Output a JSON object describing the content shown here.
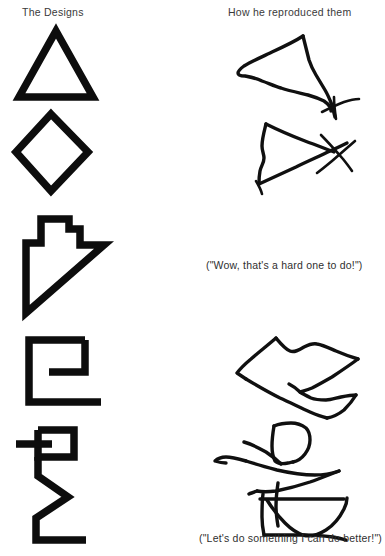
{
  "figure": {
    "background_color": "#ffffff",
    "ink_color": "#0d0d0d",
    "text_color": "#2f2f2f"
  },
  "headings": {
    "left": "The Designs",
    "right": "How he reproduced them"
  },
  "quotes": {
    "middle": "(\"Wow, that's a hard one to do!\")",
    "bottom": "(\"Let's do something I can do better!\")"
  },
  "rows": [
    {
      "index": 1,
      "model_name": "triangle",
      "model_label": "Triangle",
      "copy_name": "wobbly-triangle-with-tail",
      "copy_label": "Distorted triangle with overshooting tail stroke"
    },
    {
      "index": 2,
      "model_name": "diamond",
      "model_label": "Diamond",
      "copy_name": "sideways-triangle-with-crossed-vertex",
      "copy_label": "Sideways triangle with crossed lines at right vertex"
    },
    {
      "index": 3,
      "model_name": "arrow-polygon",
      "model_label": "Arrow polygon pointing down-left",
      "copy_name": "none",
      "copy_label": "No reproduction attempted"
    },
    {
      "index": 4,
      "model_name": "c-bracket-figure",
      "model_label": "Bracket figure with inner flag",
      "copy_name": "left-pointing-arrow-polygon",
      "copy_label": "Left-pointing angular polygon"
    },
    {
      "index": 5,
      "model_name": "flag-zigzag-figure",
      "model_label": "Square flag with zigzag stem",
      "copy_name": "fragmented-box-and-wedge",
      "copy_label": "Fragmented box, sliver and wedge shapes"
    }
  ]
}
